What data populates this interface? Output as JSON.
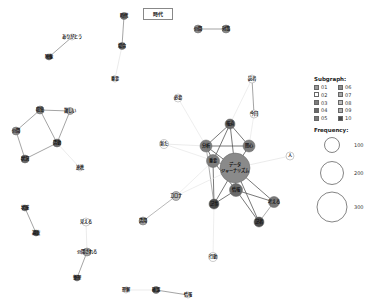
{
  "title": "時代",
  "legend": {
    "subgraph_title": "Subgraph:",
    "subgraphs": [
      {
        "id": "01",
        "color": "#9a9a9a"
      },
      {
        "id": "06",
        "color": "#8c8c8c"
      },
      {
        "id": "02",
        "color": "#ffffff"
      },
      {
        "id": "07",
        "color": "#a8a8a8"
      },
      {
        "id": "03",
        "color": "#7d7d7d"
      },
      {
        "id": "08",
        "color": "#bdbdbd"
      },
      {
        "id": "04",
        "color": "#6a6a6a"
      },
      {
        "id": "09",
        "color": "#b0b0b0"
      },
      {
        "id": "05",
        "color": "#787878"
      },
      {
        "id": "10",
        "color": "#4a4a4a"
      }
    ],
    "frequency_title": "Frequency:",
    "frequencies": [
      {
        "value": "100",
        "r": 7.5
      },
      {
        "value": "200",
        "r": 11.5
      },
      {
        "value": "300",
        "r": 15
      }
    ]
  },
  "nodes": [
    {
      "id": "n1",
      "label": "データ\nジャーナリズム",
      "x": 235,
      "y": 168,
      "r": 15,
      "color": "#8a8a8a"
    },
    {
      "id": "n2",
      "label": "報道",
      "x": 230,
      "y": 124,
      "r": 5,
      "color": "#6a6a6a"
    },
    {
      "id": "n3",
      "label": "分析",
      "x": 206,
      "y": 146,
      "r": 6,
      "color": "#7d7d7d"
    },
    {
      "id": "n4",
      "label": "関心",
      "x": 249,
      "y": 146,
      "r": 6,
      "color": "#7d7d7d"
    },
    {
      "id": "n5",
      "label": "重要",
      "x": 213,
      "y": 161,
      "r": 6.5,
      "color": "#7d7d7d"
    },
    {
      "id": "n6",
      "label": "情報",
      "x": 236,
      "y": 190,
      "r": 6.5,
      "color": "#6a6a6a"
    },
    {
      "id": "n7",
      "label": "記事",
      "x": 214,
      "y": 204,
      "r": 5,
      "color": "#4a4a4a"
    },
    {
      "id": "n8",
      "label": "考える",
      "x": 274,
      "y": 202,
      "r": 5.5,
      "color": "#787878"
    },
    {
      "id": "n9",
      "label": "記者",
      "x": 259,
      "y": 222,
      "r": 5,
      "color": "#4a4a4a"
    },
    {
      "id": "n10",
      "label": "人",
      "x": 290,
      "y": 156,
      "r": 4,
      "color": "#ffffff"
    },
    {
      "id": "n11",
      "label": "新た",
      "x": 164,
      "y": 144,
      "r": 4.5,
      "color": "#ffffff"
    },
    {
      "id": "n12",
      "label": "必要",
      "x": 178,
      "y": 98,
      "r": 4,
      "color": "#ffffff"
    },
    {
      "id": "n13",
      "label": "読者",
      "x": 252,
      "y": 79,
      "r": 4,
      "color": "#ffffff"
    },
    {
      "id": "n14",
      "label": "今回",
      "x": 254,
      "y": 114,
      "r": 4,
      "color": "#ffffff"
    },
    {
      "id": "n15",
      "label": "コロナ",
      "x": 176,
      "y": 196,
      "r": 4.5,
      "color": "#bdbdbd"
    },
    {
      "id": "n16",
      "label": "活用",
      "x": 143,
      "y": 221,
      "r": 4,
      "color": "#a8a8a8"
    },
    {
      "id": "n17",
      "label": "行動",
      "x": 213,
      "y": 257,
      "r": 4.5,
      "color": "#ffffff"
    },
    {
      "id": "n18",
      "label": "時代",
      "x": 124,
      "y": 16,
      "r": 3.5,
      "color": "#6a6a6a"
    },
    {
      "id": "n19",
      "label": "場合",
      "x": 122,
      "y": 46,
      "r": 3.5,
      "color": "#6a6a6a"
    },
    {
      "id": "n20",
      "label": "重要",
      "x": 115,
      "y": 79,
      "r": 3,
      "color": "#ffffff"
    },
    {
      "id": "n21",
      "label": "公開",
      "x": 198,
      "y": 29,
      "r": 4,
      "color": "#8c8c8c"
    },
    {
      "id": "n22",
      "label": "対策",
      "x": 226,
      "y": 29,
      "r": 4,
      "color": "#8c8c8c"
    },
    {
      "id": "n23",
      "label": "ありがとう",
      "x": 72,
      "y": 37,
      "r": 3,
      "color": "#ffffff"
    },
    {
      "id": "n24",
      "label": "映像",
      "x": 49,
      "y": 57,
      "r": 3,
      "color": "#6a6a6a"
    },
    {
      "id": "n25",
      "label": "収集",
      "x": 40,
      "y": 110,
      "r": 4,
      "color": "#8c8c8c"
    },
    {
      "id": "n26",
      "label": "難しい",
      "x": 70,
      "y": 111,
      "r": 3.5,
      "color": "#b0b0b0"
    },
    {
      "id": "n27",
      "label": "公開",
      "x": 16,
      "y": 131,
      "r": 4,
      "color": "#8c8c8c"
    },
    {
      "id": "n28",
      "label": "活動",
      "x": 57,
      "y": 143,
      "r": 4,
      "color": "#6a6a6a"
    },
    {
      "id": "n29",
      "label": "状況",
      "x": 25,
      "y": 159,
      "r": 4,
      "color": "#6a6a6a"
    },
    {
      "id": "n30",
      "label": "連携",
      "x": 80,
      "y": 168,
      "r": 3,
      "color": "#ffffff"
    },
    {
      "id": "n31",
      "label": "状態",
      "x": 25,
      "y": 208,
      "r": 3,
      "color": "#6a6a6a"
    },
    {
      "id": "n32",
      "label": "調査",
      "x": 36,
      "y": 233,
      "r": 3,
      "color": "#4a4a4a"
    },
    {
      "id": "n33",
      "label": "見える",
      "x": 86,
      "y": 222,
      "r": 4,
      "color": "#ffffff"
    },
    {
      "id": "n34",
      "label": "公開される",
      "x": 87,
      "y": 252,
      "r": 4,
      "color": "#a8a8a8"
    },
    {
      "id": "n35",
      "label": "整理",
      "x": 77,
      "y": 278,
      "r": 3,
      "color": "#6a6a6a"
    },
    {
      "id": "n36",
      "label": "理解",
      "x": 126,
      "y": 290,
      "r": 3,
      "color": "#ffffff"
    },
    {
      "id": "n37",
      "label": "確認",
      "x": 156,
      "y": 290,
      "r": 3.5,
      "color": "#6a6a6a"
    },
    {
      "id": "n38",
      "label": "情報",
      "x": 188,
      "y": 295,
      "r": 3,
      "color": "#ffffff"
    }
  ],
  "edges": [
    {
      "s": "n1",
      "t": "n2",
      "w": 0.8,
      "c": "#555"
    },
    {
      "s": "n1",
      "t": "n3",
      "w": 0.8,
      "c": "#555"
    },
    {
      "s": "n1",
      "t": "n4",
      "w": 0.8,
      "c": "#555"
    },
    {
      "s": "n1",
      "t": "n5",
      "w": 0.8,
      "c": "#555"
    },
    {
      "s": "n1",
      "t": "n6",
      "w": 0.8,
      "c": "#555"
    },
    {
      "s": "n1",
      "t": "n7",
      "w": 0.8,
      "c": "#555"
    },
    {
      "s": "n1",
      "t": "n8",
      "w": 0.8,
      "c": "#555"
    },
    {
      "s": "n1",
      "t": "n9",
      "w": 0.8,
      "c": "#555"
    },
    {
      "s": "n2",
      "t": "n3",
      "w": 0.8,
      "c": "#555"
    },
    {
      "s": "n2",
      "t": "n4",
      "w": 0.8,
      "c": "#555"
    },
    {
      "s": "n2",
      "t": "n5",
      "w": 0.8,
      "c": "#555"
    },
    {
      "s": "n3",
      "t": "n4",
      "w": 0.8,
      "c": "#555"
    },
    {
      "s": "n3",
      "t": "n5",
      "w": 0.8,
      "c": "#555"
    },
    {
      "s": "n5",
      "t": "n6",
      "w": 0.8,
      "c": "#555"
    },
    {
      "s": "n5",
      "t": "n7",
      "w": 0.8,
      "c": "#555"
    },
    {
      "s": "n6",
      "t": "n7",
      "w": 0.8,
      "c": "#555"
    },
    {
      "s": "n6",
      "t": "n8",
      "w": 0.8,
      "c": "#555"
    },
    {
      "s": "n6",
      "t": "n9",
      "w": 0.8,
      "c": "#555"
    },
    {
      "s": "n8",
      "t": "n9",
      "w": 0.6,
      "c": "#777"
    },
    {
      "s": "n3",
      "t": "n7",
      "w": 0.6,
      "c": "#777"
    },
    {
      "s": "n13",
      "t": "n14",
      "w": 0.6,
      "c": "#666"
    },
    {
      "s": "n15",
      "t": "n16",
      "w": 0.6,
      "c": "#888"
    },
    {
      "s": "n1",
      "t": "n10",
      "w": 0.6,
      "c": "#ddd"
    },
    {
      "s": "n3",
      "t": "n11",
      "w": 0.6,
      "c": "#ddd"
    },
    {
      "s": "n1",
      "t": "n11",
      "w": 0.6,
      "c": "#e3e3e3"
    },
    {
      "s": "n3",
      "t": "n12",
      "w": 0.6,
      "c": "#e3e3e3"
    },
    {
      "s": "n4",
      "t": "n14",
      "w": 0.6,
      "c": "#e3e3e3"
    },
    {
      "s": "n2",
      "t": "n13",
      "w": 0.6,
      "c": "#e3e3e3"
    },
    {
      "s": "n1",
      "t": "n15",
      "w": 0.6,
      "c": "#e3e3e3"
    },
    {
      "s": "n5",
      "t": "n15",
      "w": 0.6,
      "c": "#e3e3e3"
    },
    {
      "s": "n7",
      "t": "n17",
      "w": 0.6,
      "c": "#e3e3e3"
    },
    {
      "s": "n18",
      "t": "n19",
      "w": 0.6,
      "c": "#666"
    },
    {
      "s": "n19",
      "t": "n20",
      "w": 0.6,
      "c": "#ddd"
    },
    {
      "s": "n21",
      "t": "n22",
      "w": 0.6,
      "c": "#666"
    },
    {
      "s": "n23",
      "t": "n24",
      "w": 0.6,
      "c": "#666"
    },
    {
      "s": "n25",
      "t": "n26",
      "w": 0.6,
      "c": "#666"
    },
    {
      "s": "n25",
      "t": "n27",
      "w": 0.6,
      "c": "#666"
    },
    {
      "s": "n25",
      "t": "n28",
      "w": 0.6,
      "c": "#666"
    },
    {
      "s": "n26",
      "t": "n28",
      "w": 0.6,
      "c": "#666"
    },
    {
      "s": "n27",
      "t": "n29",
      "w": 0.6,
      "c": "#666"
    },
    {
      "s": "n28",
      "t": "n29",
      "w": 0.6,
      "c": "#666"
    },
    {
      "s": "n28",
      "t": "n30",
      "w": 0.6,
      "c": "#ddd"
    },
    {
      "s": "n31",
      "t": "n32",
      "w": 0.6,
      "c": "#666"
    },
    {
      "s": "n33",
      "t": "n34",
      "w": 0.6,
      "c": "#ddd"
    },
    {
      "s": "n34",
      "t": "n35",
      "w": 0.6,
      "c": "#666"
    },
    {
      "s": "n36",
      "t": "n37",
      "w": 0.6,
      "c": "#ddd"
    },
    {
      "s": "n37",
      "t": "n38",
      "w": 0.6,
      "c": "#666"
    }
  ]
}
